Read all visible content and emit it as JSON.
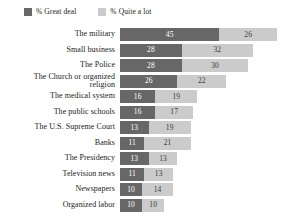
{
  "legend": {
    "items": [
      {
        "label": "% Great deal",
        "color": "#676767",
        "key": "great_deal"
      },
      {
        "label": "% Quite a lot",
        "color": "#cbcbcb",
        "key": "quite_a_lot"
      }
    ]
  },
  "chart_data": {
    "type": "bar",
    "title": "",
    "subtitle": "",
    "xlabel": "",
    "ylabel": "",
    "orientation": "horizontal",
    "stacked": true,
    "grid": false,
    "legend_position": "top-left",
    "xlim": [
      0,
      71
    ],
    "categories": [
      "The military",
      "Small business",
      "The Police",
      "The Church or organized\nreligion",
      "The medical system",
      "The public schools",
      "The U.S. Supreme Court",
      "Banks",
      "The Presidency",
      "Television news",
      "Newspapers",
      "Organized labor"
    ],
    "series": [
      {
        "name": "% Great deal",
        "color": "#676767",
        "values": [
          45,
          28,
          28,
          26,
          16,
          16,
          13,
          11,
          13,
          11,
          10,
          10
        ]
      },
      {
        "name": "% Quite a lot",
        "color": "#cbcbcb",
        "values": [
          26,
          32,
          30,
          22,
          19,
          17,
          19,
          21,
          13,
          13,
          14,
          10
        ]
      }
    ],
    "totals": [
      71,
      60,
      58,
      48,
      35,
      33,
      32,
      32,
      26,
      24,
      24,
      20
    ]
  },
  "scale": {
    "px_per_unit": 2.21
  }
}
